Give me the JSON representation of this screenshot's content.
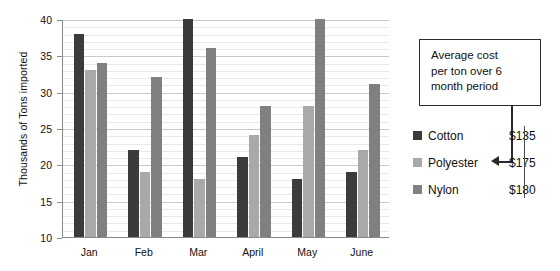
{
  "chart_data": {
    "type": "bar",
    "title": "",
    "subtitle": "",
    "xlabel": "",
    "ylabel": "Thousands of Tons imported",
    "categories": [
      "Jan",
      "Feb",
      "Mar",
      "April",
      "May",
      "June"
    ],
    "series": [
      {
        "name": "Cotton",
        "color": "#3b3b3b",
        "values": [
          38,
          22,
          40,
          21,
          18,
          19
        ]
      },
      {
        "name": "Polyester",
        "color": "#a9a9a9",
        "values": [
          33,
          19,
          18,
          24,
          28,
          22
        ]
      },
      {
        "name": "Nylon",
        "color": "#808080",
        "values": [
          34,
          32,
          36,
          28,
          40,
          31
        ]
      }
    ],
    "ylim": [
      10,
      40
    ],
    "yticks": [
      10,
      15,
      20,
      25,
      30,
      35,
      40
    ],
    "ytick_labels": [
      "10",
      "15",
      "20",
      "25",
      "30",
      "35",
      "40"
    ],
    "minor_tick_step": 1,
    "grid": true,
    "grid_axis": "y",
    "legend_position": "right",
    "bar_group_orientation": "vertical"
  },
  "callout": {
    "lines": [
      "Average cost",
      "per ton over 6",
      "month period"
    ],
    "points_to": "Polyester"
  },
  "legend": {
    "entries": [
      {
        "label": "Cotton",
        "price": "$135",
        "swatch": "#3b3b3b"
      },
      {
        "label": "Polyester",
        "price": "$175",
        "swatch": "#a9a9a9"
      },
      {
        "label": "Nylon",
        "price": "$180",
        "swatch": "#808080"
      }
    ]
  },
  "colors": {
    "cotton": "#3b3b3b",
    "polyester": "#a9a9a9",
    "nylon": "#808080",
    "axis": "#8a8a8a",
    "grid_minor": "#e8e8e8",
    "grid_major": "#c9c9c9",
    "text": "#111111",
    "callout_border": "#2b2b2b",
    "background": "#ffffff"
  }
}
